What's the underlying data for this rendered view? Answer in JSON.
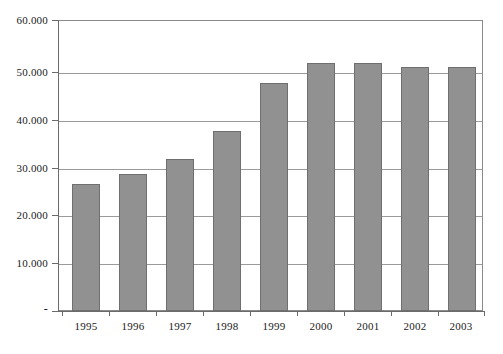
{
  "chart_data": {
    "type": "bar",
    "title": "",
    "subtitle": "",
    "xlabel": "",
    "ylabel": "",
    "categories": [
      "1995",
      "1996",
      "1997",
      "1998",
      "1999",
      "2000",
      "2001",
      "2002",
      "2003"
    ],
    "values": [
      26400,
      28500,
      31600,
      37600,
      47500,
      51600,
      51600,
      50800,
      50800
    ],
    "series": [
      {
        "name": "",
        "values": [
          26400,
          28500,
          31600,
          37600,
          47500,
          51600,
          51600,
          50800,
          50800
        ]
      }
    ],
    "ylim": [
      0,
      60000
    ],
    "ytick_values": [
      0,
      10000,
      20000,
      30000,
      40000,
      50000,
      60000
    ],
    "ytick_labels": [
      "-",
      "10.000",
      "20.000",
      "30.000",
      "40.000",
      "50.000",
      "60.000"
    ],
    "xtick_labels": [
      "1995",
      "1996",
      "1997",
      "1998",
      "1999",
      "2000",
      "2001",
      "2002",
      "2003"
    ],
    "grid": "horizontal",
    "legend": "none",
    "annotations": [],
    "colors": {
      "bar_fill": "#919191",
      "bar_border": "#6f6f6f",
      "gridline": "#9a9a9a",
      "axis": "#6a6a6a",
      "plot_border": "#8a8a8a",
      "background": "#ffffff",
      "text": "#1a1a1a"
    }
  }
}
